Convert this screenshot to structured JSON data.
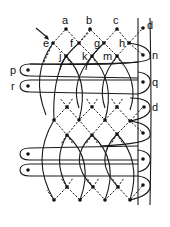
{
  "diagram": {
    "type": "bobbin-lace-pricking",
    "pin_labels": {
      "a": "a",
      "b": "b",
      "c": "c",
      "d_top": "d",
      "e": "e",
      "f": "f",
      "g": "g",
      "h": "h",
      "j": "j",
      "k": "k",
      "m": "m",
      "n": "n",
      "p": "p",
      "q": "q",
      "r": "r",
      "d_mid": "d"
    },
    "start_arrow": "arrow pointing to pin e",
    "ground_rows_upper": 3,
    "ground_rows_middle": 3,
    "ground_rows_lower": 2,
    "edge_pins_right": 7,
    "passive_loops_left": 4,
    "colors": {
      "ink": "#1a1a1a",
      "background": "#ffffff"
    }
  }
}
